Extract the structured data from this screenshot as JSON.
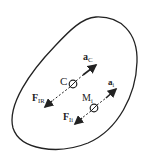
{
  "diagram": {
    "title": "",
    "body_outline": "closed irregular rigid body",
    "points": {
      "C": {
        "label": "C"
      },
      "Mi": {
        "label": "M",
        "subscript": "i"
      }
    },
    "vectors": {
      "aC": {
        "label": "a",
        "subscript": "C"
      },
      "ai": {
        "label": "a",
        "subscript": "i"
      },
      "FIR": {
        "label": "F",
        "subscript": "IR"
      },
      "FIi": {
        "label": "F",
        "subscript": "Ii"
      }
    },
    "colors": {
      "stroke": "#222222",
      "background": "#ffffff"
    }
  }
}
